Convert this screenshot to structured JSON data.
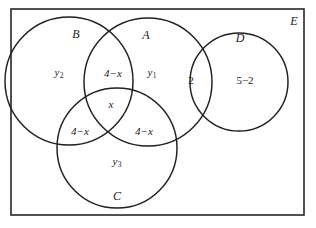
{
  "diagram": {
    "type": "venn-diagram",
    "title_visible": false,
    "universe": {
      "label": "E",
      "shape": "rectangle",
      "stroke_color": "#262626"
    },
    "stroke_color": "#1f1f1f",
    "fill_color": "#ffffff",
    "background_color": "#ffffff",
    "sets": [
      {
        "id": "B",
        "label": "B",
        "cx": 69,
        "cy": 81,
        "r": 64,
        "label_x": 76,
        "label_y": 34
      },
      {
        "id": "A",
        "label": "A",
        "cx": 148,
        "cy": 82,
        "r": 64,
        "label_x": 146,
        "label_y": 35
      },
      {
        "id": "D",
        "label": "D",
        "cx": 239,
        "cy": 82,
        "r": 49,
        "label_x": 240,
        "label_y": 38
      },
      {
        "id": "C",
        "label": "C",
        "cx": 117,
        "cy": 148,
        "r": 60,
        "label_x": 117,
        "label_y": 196
      }
    ],
    "regions": [
      {
        "id": "B-only",
        "value": "y",
        "subscript": "2",
        "x": 59,
        "y": 73
      },
      {
        "id": "A-and-B",
        "value": "4−x",
        "subscript": "",
        "x": 113,
        "y": 73
      },
      {
        "id": "A-only",
        "value": "y",
        "subscript": "1",
        "x": 152,
        "y": 73
      },
      {
        "id": "A-and-D",
        "value": "2",
        "subscript": "",
        "x": 191,
        "y": 80
      },
      {
        "id": "D-only",
        "value": "5−2",
        "subscript": "",
        "x": 245,
        "y": 80
      },
      {
        "id": "A-B-and-C",
        "value": "x",
        "subscript": "",
        "x": 111,
        "y": 104
      },
      {
        "id": "B-and-C",
        "value": "4−x",
        "subscript": "",
        "x": 80,
        "y": 131
      },
      {
        "id": "A-and-C",
        "value": "4−x",
        "subscript": "",
        "x": 144,
        "y": 131
      },
      {
        "id": "C-only",
        "value": "y",
        "subscript": "3",
        "x": 117,
        "y": 162
      }
    ],
    "universe_label_pos": {
      "x": 294,
      "y": 21
    },
    "frame": {
      "x": 11,
      "y": 9,
      "width": 293,
      "height": 206
    }
  }
}
